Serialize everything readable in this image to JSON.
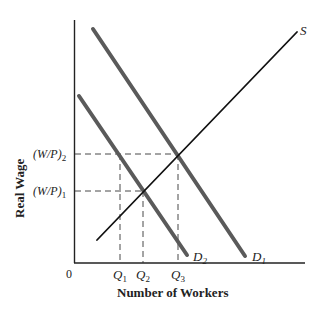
{
  "diagram": {
    "type": "labor-market-supply-demand",
    "y_axis_label": "Real Wage",
    "x_axis_label": "Number of Workers",
    "origin_label": "0",
    "y_ticks": [
      {
        "base": "(W/P)",
        "sub": "2",
        "y": 154
      },
      {
        "base": "(W/P)",
        "sub": "1",
        "y": 191
      }
    ],
    "x_ticks": [
      {
        "base": "Q",
        "sub": "1",
        "x": 120
      },
      {
        "base": "Q",
        "sub": "2",
        "x": 143
      },
      {
        "base": "Q",
        "sub": "3",
        "x": 178
      }
    ],
    "curves": [
      {
        "name": "S",
        "label": "S",
        "sub": "",
        "kind": "supply",
        "color": "#111111"
      },
      {
        "name": "D1",
        "label": "D",
        "sub": "1",
        "kind": "demand",
        "color": "#555555"
      },
      {
        "name": "D2",
        "label": "D",
        "sub": "2",
        "kind": "demand",
        "color": "#555555"
      }
    ],
    "equilibria": [
      {
        "curves": [
          "S",
          "D2"
        ],
        "wage": "(W/P)1",
        "quantity": "Q2"
      },
      {
        "curves": [
          "S",
          "D1"
        ],
        "wage": "(W/P)2",
        "quantity": "Q3"
      }
    ]
  }
}
